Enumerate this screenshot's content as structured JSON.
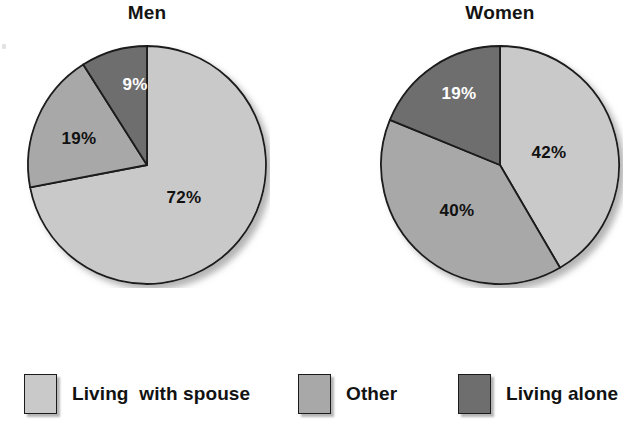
{
  "chart_data": {
    "type": "pie",
    "title": "",
    "legend_position": "bottom",
    "grid": false,
    "categories": [
      "Living  with spouse",
      "Other",
      "Living alone"
    ],
    "colors": {
      "living_with_spouse": "#c9c9c9",
      "other": "#a8a8a8",
      "living_alone": "#6e6e6e",
      "outline": "#1a1a1a",
      "background": "#ffffff"
    },
    "charts": [
      {
        "title": "Men",
        "slices": [
          {
            "label": "Living  with spouse",
            "value": 72,
            "display": "72%",
            "color": "#c9c9c9",
            "label_color": "dark"
          },
          {
            "label": "Other",
            "value": 19,
            "display": "19%",
            "color": "#a8a8a8",
            "label_color": "dark"
          },
          {
            "label": "Living alone",
            "value": 9,
            "display": "9%",
            "color": "#6e6e6e",
            "label_color": "light"
          }
        ]
      },
      {
        "title": "Women",
        "slices": [
          {
            "label": "Living  with spouse",
            "value": 42,
            "display": "42%",
            "color": "#c9c9c9",
            "label_color": "dark"
          },
          {
            "label": "Other",
            "value": 40,
            "display": "40%",
            "color": "#a8a8a8",
            "label_color": "dark"
          },
          {
            "label": "Living alone",
            "value": 19,
            "display": "19%",
            "color": "#6e6e6e",
            "label_color": "light"
          }
        ]
      }
    ]
  },
  "charts": {
    "men": {
      "title": "Men",
      "labels": {
        "spouse": "72%",
        "other": "19%",
        "alone": "9%"
      }
    },
    "women": {
      "title": "Women",
      "labels": {
        "spouse": "42%",
        "other": "40%",
        "alone": "19%"
      }
    }
  },
  "legend": {
    "items": [
      {
        "label": "Living  with spouse",
        "color": "#c9c9c9"
      },
      {
        "label": "Other",
        "color": "#a8a8a8"
      },
      {
        "label": "Living alone",
        "color": "#6e6e6e"
      }
    ]
  }
}
